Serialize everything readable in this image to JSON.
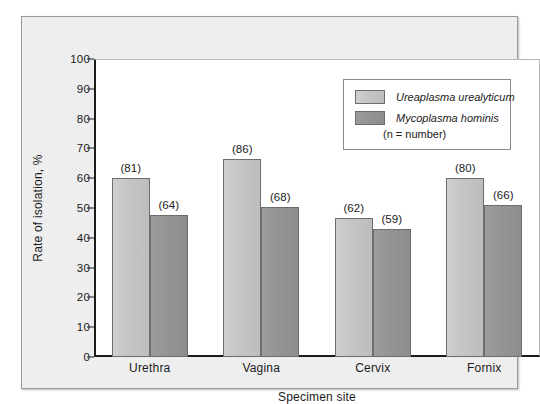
{
  "chart_data": {
    "type": "bar",
    "title": "",
    "xlabel": "Specimen site",
    "ylabel": "Rate of isolation, %",
    "ylim": [
      0,
      100
    ],
    "ytick_step": 10,
    "yticks": [
      "100",
      "90",
      "80",
      "70",
      "60",
      "50",
      "40",
      "30",
      "20",
      "10",
      "0"
    ],
    "grid": false,
    "legend_position": "top-right",
    "categories": [
      "Urethra",
      "Vagina",
      "Cervix",
      "Fornix"
    ],
    "series": [
      {
        "name": "Ureaplasma urealyticum",
        "color": "#c4c4c4",
        "values": [
          60,
          66.5,
          46.5,
          60
        ],
        "annotations": [
          "(81)",
          "(86)",
          "(62)",
          "(80)"
        ]
      },
      {
        "name": "Mycoplasma hominis",
        "color": "#949494",
        "values": [
          47.5,
          50.5,
          43,
          51
        ],
        "annotations": [
          "(64)",
          "(68)",
          "(59)",
          "(66)"
        ]
      }
    ],
    "legend_note": "(n = number)"
  },
  "figure": {
    "panel_background": "#eeeeee",
    "plot_background": "#ffffff",
    "axis_color": "#1b1b1b"
  }
}
